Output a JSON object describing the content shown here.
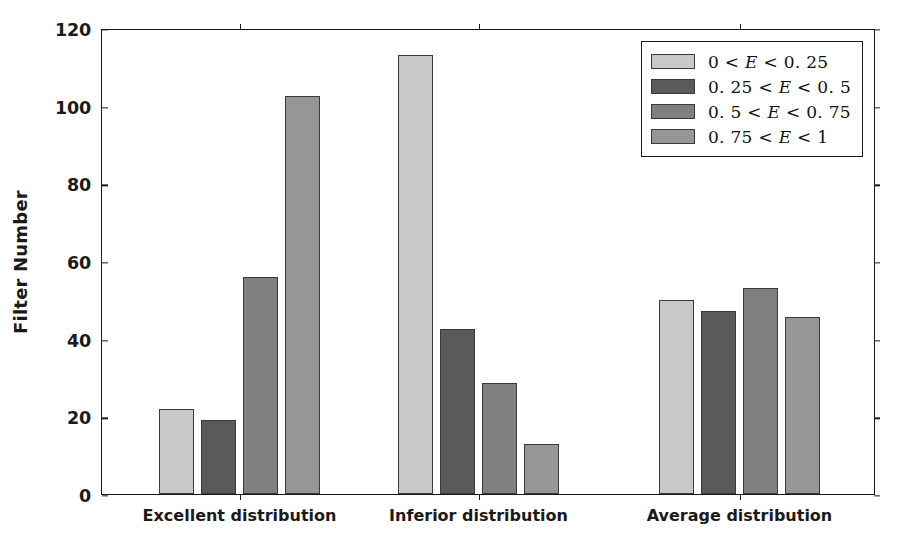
{
  "chart_data": {
    "type": "bar",
    "title": "",
    "xlabel": "",
    "ylabel": "Filter Number",
    "ylim": [
      0,
      120
    ],
    "yticks": [
      0,
      20,
      40,
      60,
      80,
      100,
      120
    ],
    "grid": false,
    "legend_position": "upper right",
    "categories": [
      "Excellent distribution",
      "Inferior distribution",
      "Average distribution"
    ],
    "series": [
      {
        "name": "0 < E < 0.25",
        "color": "#c8c8c8",
        "values": [
          22,
          113,
          50
        ]
      },
      {
        "name": "0.25 < E < 0.5",
        "color": "#5a5a5a",
        "values": [
          19,
          42.5,
          47
        ]
      },
      {
        "name": "0.5 < E < 0.75",
        "color": "#808080",
        "values": [
          56,
          28.5,
          53
        ]
      },
      {
        "name": "0.75 < E < 1",
        "color": "#969696",
        "values": [
          102.5,
          13,
          45.5
        ]
      }
    ]
  },
  "legend": {
    "items": [
      {
        "label": "0 < E < 0.25",
        "lhs": "0 <",
        "mid": "E",
        "rhs": "< 0. 25",
        "color": "#c8c8c8"
      },
      {
        "label": "0.25 < E < 0.5",
        "lhs": "0. 25 <",
        "mid": "E",
        "rhs": "< 0. 5",
        "color": "#5a5a5a"
      },
      {
        "label": "0.5 < E < 0.75",
        "lhs": "0. 5 <",
        "mid": "E",
        "rhs": "< 0. 75",
        "color": "#808080"
      },
      {
        "label": "0.75 < E < 1",
        "lhs": "0. 75 <",
        "mid": "E",
        "rhs": "< 1",
        "color": "#969696"
      }
    ]
  },
  "axes": {
    "y_label": "Filter Number",
    "y_ticks": [
      "0",
      "20",
      "40",
      "60",
      "80",
      "100",
      "120"
    ],
    "x_ticks": [
      "Excellent distribution",
      "Inferior distribution",
      "Average distribution"
    ]
  },
  "style": {
    "background": "#ffffff",
    "spine_color": "#1a1a1a",
    "bar_edge": "#3a3a3a"
  }
}
